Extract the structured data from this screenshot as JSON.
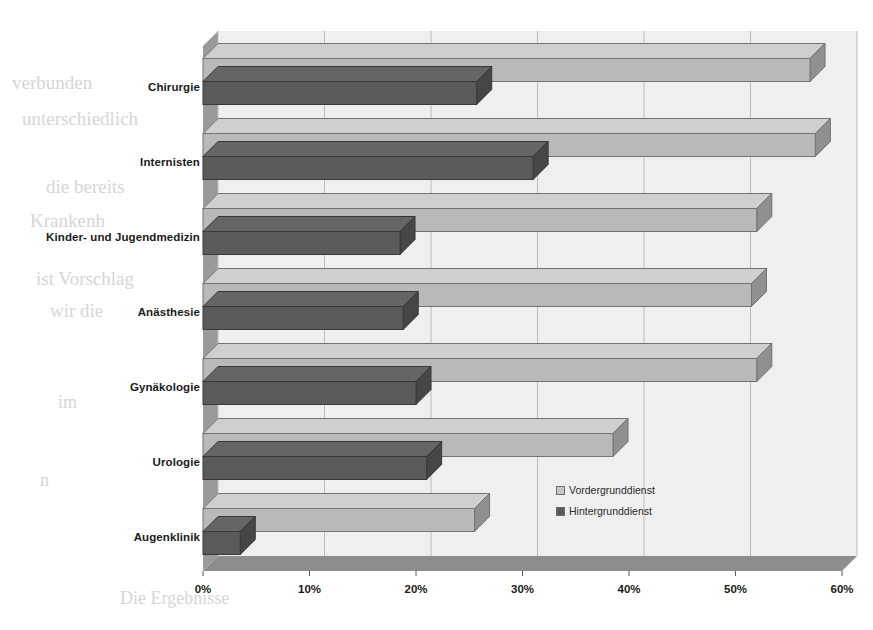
{
  "chart_data": {
    "type": "bar",
    "orientation": "horizontal",
    "title": "",
    "xlabel": "",
    "ylabel": "",
    "xlim": [
      0,
      60
    ],
    "xticks": [
      "0%",
      "10%",
      "20%",
      "30%",
      "40%",
      "50%",
      "60%"
    ],
    "xtick_values": [
      0,
      10,
      20,
      30,
      40,
      50,
      60
    ],
    "grid": true,
    "legend_position": "inside-lower-right",
    "categories": [
      "Chirurgie",
      "Internisten",
      "Kinder- und Jugendmedizin",
      "Anästhesie",
      "Gynäkologie",
      "Urologie",
      "Augenklinik"
    ],
    "series": [
      {
        "name": "Vordergrunddienst",
        "color": "#b9b9b9",
        "values": [
          57.0,
          57.5,
          52.0,
          51.5,
          52.0,
          38.5,
          25.5
        ]
      },
      {
        "name": "Hintergrunddienst",
        "color": "#5a5a5a",
        "values": [
          25.7,
          31.0,
          18.5,
          18.8,
          20.0,
          21.0,
          3.5
        ]
      }
    ]
  },
  "legend": {
    "items": [
      {
        "label": "Vordergrunddienst",
        "swatch": "light-grey-square"
      },
      {
        "label": "Hintergrunddienst",
        "swatch": "dark-grey-square"
      }
    ]
  },
  "colors": {
    "series_light": "#b9b9b9",
    "series_dark": "#5a5a5a",
    "plot_floor": "#8e8e8e",
    "plot_back": "#eeeeee",
    "gridline": "#bdbdbd",
    "axis_text": "#1a1a1a"
  },
  "background_text": {
    "lines": [
      {
        "text": "verbunden",
        "x": 12,
        "y": 72,
        "size": 19
      },
      {
        "text": "unterschiedlich",
        "x": 22,
        "y": 108,
        "size": 19
      },
      {
        "text": "die bereits",
        "x": 46,
        "y": 176,
        "size": 19
      },
      {
        "text": "Krankenh",
        "x": 30,
        "y": 210,
        "size": 19
      },
      {
        "text": "ist Vorschlag",
        "x": 36,
        "y": 268,
        "size": 19
      },
      {
        "text": "wir die",
        "x": 50,
        "y": 300,
        "size": 19
      },
      {
        "text": "im",
        "x": 58,
        "y": 392,
        "size": 18
      },
      {
        "text": "n",
        "x": 40,
        "y": 470,
        "size": 18
      },
      {
        "text": "Die Ergebnisse",
        "x": 120,
        "y": 588,
        "size": 18
      },
      {
        "text": "gegen",
        "x": 700,
        "y": 300,
        "size": 18
      },
      {
        "text": "auf",
        "x": 750,
        "y": 360,
        "size": 18
      },
      {
        "text": "der",
        "x": 790,
        "y": 420,
        "size": 18
      }
    ]
  }
}
